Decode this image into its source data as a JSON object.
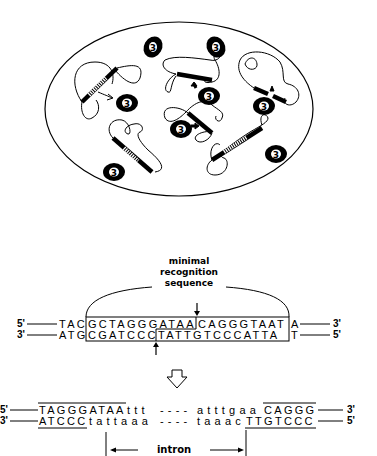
{
  "figure": {
    "cell_panel": {
      "description": "Cell (oval) containing DNA molecules and endonuclease I-SceI proteins labeled 3",
      "protein_label": "3",
      "protein_count": 8
    },
    "recognition_panel": {
      "label_line1": "minimal",
      "label_line2": "recognition",
      "label_line3": "sequence",
      "top_strand": {
        "end_left": "5'",
        "end_right": "3'",
        "flank_left": "TAC",
        "boxed_part1": "GCTAGGGATAA",
        "boxed_part2": "CAGGGTAAT",
        "flank_right": "A"
      },
      "bottom_strand": {
        "end_left": "3'",
        "end_right": "5'",
        "flank_left": "ATG",
        "boxed_part1": "CGATCCC",
        "boxed_part2": "TATTGTCCCATTA",
        "flank_right": "T"
      }
    },
    "arrow": "down-outline-arrow",
    "intron_panel": {
      "top_strand": {
        "end_left": "5'",
        "end_right": "3'",
        "exon_left": "TAGGGATAA",
        "intron_left": "ttt",
        "gap": "----",
        "intron_right": "atttgaa",
        "exon_right": "CAGGG"
      },
      "bottom_strand": {
        "end_left": "3'",
        "end_right": "5'",
        "exon_left": "ATCCC",
        "intron_left": "tattaaa",
        "gap": "----",
        "intron_right": "taaac",
        "exon_right": "TTGTCCC"
      },
      "intron_label": "intron"
    }
  }
}
